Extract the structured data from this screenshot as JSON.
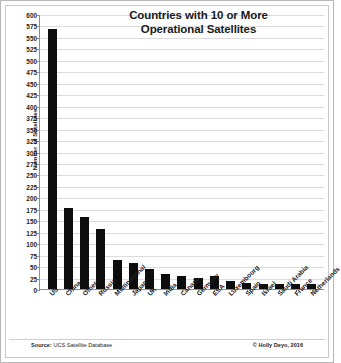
{
  "chart_data": {
    "type": "bar",
    "title": "Countries with 10 or More Operational Satellites",
    "title_line1": "Countries with 10 or More",
    "title_line2": "Operational Satellites",
    "xlabel": "",
    "ylabel": "Number of Satellites",
    "ylim": [
      0,
      600
    ],
    "ytick_step": 25,
    "grid": true,
    "legend": "none",
    "bar_color": "#0d0d0d",
    "categories": [
      "US",
      "China",
      "Others",
      "Russia",
      "Multinational",
      "Japan",
      "UK",
      "India",
      "Canada",
      "Germany",
      "ESA",
      "Luxembourg",
      "Spain",
      "Israel",
      "Saudi Arabia",
      "France",
      "Netherlands"
    ],
    "values": [
      568,
      176,
      158,
      130,
      64,
      56,
      43,
      33,
      29,
      23,
      28,
      17,
      13,
      11,
      10,
      10,
      10
    ],
    "ytick_labels": [
      "600",
      "575",
      "550",
      "525",
      "500",
      "475",
      "450",
      "425",
      "400",
      "375",
      "350",
      "325",
      "300",
      "275",
      "250",
      "225",
      "200",
      "175",
      "150",
      "125",
      "100",
      "75",
      "50",
      "25",
      "0"
    ],
    "annotations": {
      "source": "Source: UCS Satellite Database",
      "source_prefix": "Source:",
      "source_body": " UCS Satellite Database",
      "copyright": "© Holly Deyo, 2016"
    }
  },
  "figure": {
    "background": "#ffffff",
    "border_color": "#b8b8b8",
    "gridline_color": "#dcdcdc",
    "axis_color": "#8e8e8e"
  }
}
